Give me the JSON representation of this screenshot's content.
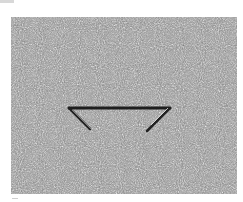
{
  "image": {
    "description": "Grainy grayscale photograph of a speckled surface with a dark bent-wire shape (horizontal bar with two angled legs) near the center",
    "colors": {
      "background": "#ffffff",
      "texture_mid": "#8a8a8a",
      "wire": "#1e1e1e",
      "highlight": "#e6e6e6"
    }
  }
}
